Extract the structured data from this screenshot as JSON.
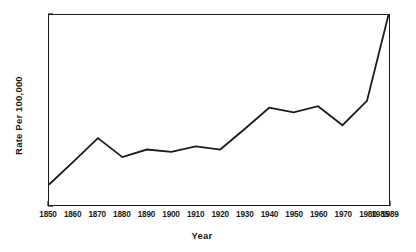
{
  "chart_data": {
    "type": "line",
    "title": "",
    "subtitle": "",
    "xlabel": "Year",
    "ylabel": "Rate Per 100,000",
    "xlim": [
      1850,
      1989
    ],
    "ylim": [
      0,
      250
    ],
    "grid": false,
    "legend": false,
    "legend_position": "none",
    "line_color": "#1a1a1a",
    "axis_color": "#1a1a1a",
    "background_color": "#ffffff",
    "x_ticks": [
      1850,
      1860,
      1870,
      1880,
      1890,
      1900,
      1910,
      1920,
      1930,
      1940,
      1950,
      1960,
      1970,
      1980,
      1985,
      1989
    ],
    "x_tick_labels": [
      "1850",
      "1860",
      "1870",
      "1880",
      "1890",
      "1900",
      "1910",
      "1920",
      "1930",
      "1940",
      "1950",
      "1960",
      "1970",
      "1980",
      "1985",
      "1989"
    ],
    "y_ticks": [
      0,
      50,
      100,
      150,
      200,
      250
    ],
    "y_tick_labels": [
      "0",
      "50",
      "100",
      "150",
      "200",
      "250"
    ],
    "x": [
      1850,
      1860,
      1870,
      1880,
      1890,
      1900,
      1910,
      1920,
      1930,
      1940,
      1950,
      1960,
      1970,
      1980,
      1989
    ],
    "values": [
      27,
      57,
      88,
      63,
      73,
      70,
      77,
      73,
      100,
      128,
      122,
      130,
      105,
      137,
      253
    ],
    "points": [
      {
        "year": 1850,
        "rate": 27
      },
      {
        "year": 1860,
        "rate": 57
      },
      {
        "year": 1870,
        "rate": 88
      },
      {
        "year": 1880,
        "rate": 63
      },
      {
        "year": 1890,
        "rate": 73
      },
      {
        "year": 1900,
        "rate": 70
      },
      {
        "year": 1910,
        "rate": 77
      },
      {
        "year": 1920,
        "rate": 73
      },
      {
        "year": 1930,
        "rate": 100
      },
      {
        "year": 1940,
        "rate": 128
      },
      {
        "year": 1950,
        "rate": 122
      },
      {
        "year": 1960,
        "rate": 130
      },
      {
        "year": 1970,
        "rate": 105
      },
      {
        "year": 1980,
        "rate": 137
      },
      {
        "year": 1989,
        "rate": 253
      }
    ]
  }
}
